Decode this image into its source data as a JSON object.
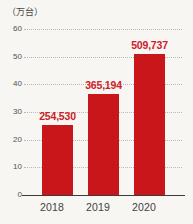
{
  "chart_data": {
    "type": "bar",
    "title": "",
    "subtitle": "",
    "unit_label": "（万台）",
    "categories": [
      "2018",
      "2019",
      "2020"
    ],
    "values": [
      25.453,
      36.5194,
      50.9737
    ],
    "data_labels": [
      "254,530",
      "365,194",
      "509,737"
    ],
    "xlabel": "",
    "ylabel": "万台",
    "ylim": [
      0,
      60
    ],
    "yticks": [
      0,
      10,
      20,
      30,
      40,
      50,
      60
    ],
    "ytick_labels": [
      "0",
      "10",
      "20",
      "30",
      "40",
      "50",
      "60"
    ],
    "grid": true,
    "grid_style": "dotted",
    "legend": false,
    "legend_position": "none",
    "series": [
      {
        "name": "台数",
        "values": [
          25.453,
          36.5194,
          50.9737
        ],
        "labels": [
          "254,530",
          "365,194",
          "509,737"
        ]
      }
    ]
  },
  "colors": {
    "bar": "#c8161a",
    "data_label": "#cf2025",
    "axis": "#3d3a37",
    "gridline": "#b9b4ae",
    "tick_text": "#55514d",
    "background": "#f7f6f3"
  }
}
